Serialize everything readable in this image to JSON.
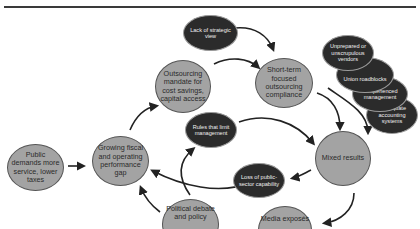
{
  "diagram": {
    "nodes": {
      "public_demands": "Public demands more service, lower taxes",
      "growing_gap": "Growing fiscal and operating performance gap",
      "outsourcing_mandate": "Outsourcing mandate for cost savings, capital access",
      "lack_strategic": "Lack of strategic view",
      "short_term": "Short-term focused outsourcing compliance",
      "rules_limit": "Rules that limit management",
      "mixed_results": "Mixed results",
      "loss_capability": "Loss of public-sector capability",
      "political_debate": "Political debate and policy",
      "media_exposes": "Media exposés",
      "unprepared_vendors": "Unprepared or unscrupulous vendors",
      "union_roadblocks": "Union roadblocks",
      "inexperienced_mgmt": "Inexperienced management",
      "inadequate_accounting": "Inadequate accounting systems"
    },
    "colors": {
      "light_node": "#a3a3a3",
      "dark_node": "#2b2b2b",
      "arrow": "#222222"
    }
  }
}
